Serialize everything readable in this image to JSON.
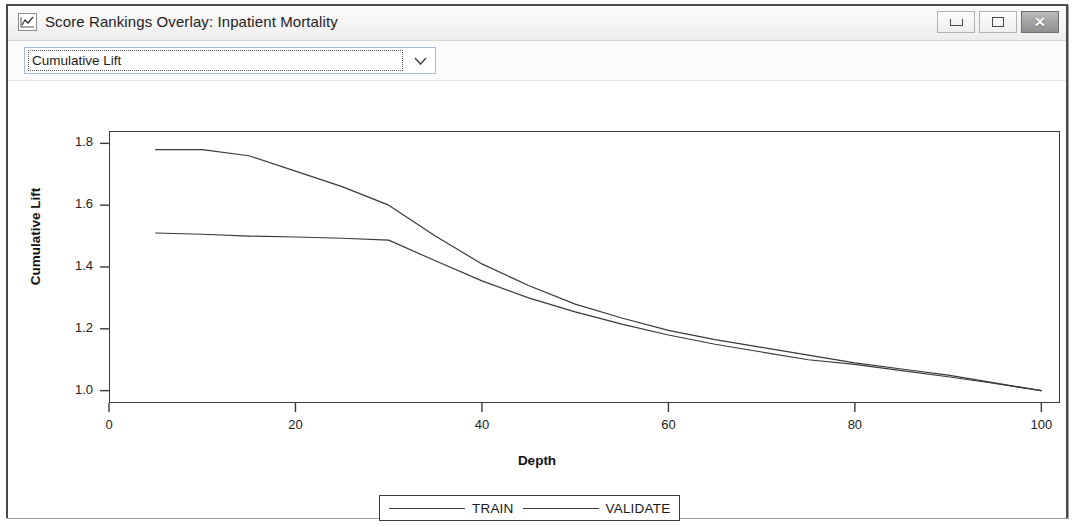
{
  "window": {
    "title": "Score Rankings Overlay: Inpatient Mortality",
    "icon": "line-chart-icon",
    "buttons": {
      "minimize": "minimize-icon",
      "maximize": "maximize-icon",
      "close": "✕"
    }
  },
  "toolbar": {
    "plot_select": {
      "value": "Cumulative Lift",
      "arrow": "chevron-down-icon"
    }
  },
  "chart_data": {
    "type": "line",
    "title": "",
    "xlabel": "Depth",
    "ylabel": "Cumulative Lift",
    "xlim": [
      0,
      102
    ],
    "ylim": [
      0.96,
      1.84
    ],
    "xticks": [
      0,
      20,
      40,
      60,
      80,
      100
    ],
    "yticks": [
      "1.0",
      "1.2",
      "1.4",
      "1.6",
      "1.8"
    ],
    "grid": false,
    "legend_position": "bottom-center",
    "series": [
      {
        "name": "TRAIN",
        "color": "#3a3a3a",
        "x": [
          5,
          10,
          15,
          20,
          25,
          30,
          35,
          40,
          45,
          50,
          55,
          60,
          65,
          70,
          75,
          80,
          85,
          90,
          95,
          100
        ],
        "y": [
          1.78,
          1.78,
          1.76,
          1.71,
          1.66,
          1.6,
          1.5,
          1.41,
          1.34,
          1.28,
          1.235,
          1.195,
          1.165,
          1.14,
          1.115,
          1.09,
          1.07,
          1.05,
          1.025,
          1.0
        ]
      },
      {
        "name": "VALIDATE",
        "color": "#3a3a3a",
        "x": [
          5,
          10,
          15,
          20,
          25,
          30,
          35,
          40,
          45,
          50,
          55,
          60,
          65,
          70,
          75,
          80,
          85,
          90,
          95,
          100
        ],
        "y": [
          1.51,
          1.506,
          1.5,
          1.497,
          1.493,
          1.487,
          1.42,
          1.355,
          1.3,
          1.255,
          1.215,
          1.18,
          1.15,
          1.125,
          1.1,
          1.085,
          1.065,
          1.045,
          1.023,
          1.0
        ]
      }
    ]
  }
}
